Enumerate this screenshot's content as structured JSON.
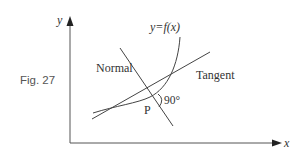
{
  "figure": {
    "caption": "Fig. 27",
    "axes": {
      "x_label": "x",
      "y_label": "y"
    },
    "curve_label": "y=f(x)",
    "normal_label": "Normal",
    "tangent_label": "Tangent",
    "point_label": "P",
    "angle_label": "90°"
  },
  "colors": {
    "line": "#444444",
    "axis": "#555555",
    "text": "#333333",
    "background": "#ffffff"
  }
}
